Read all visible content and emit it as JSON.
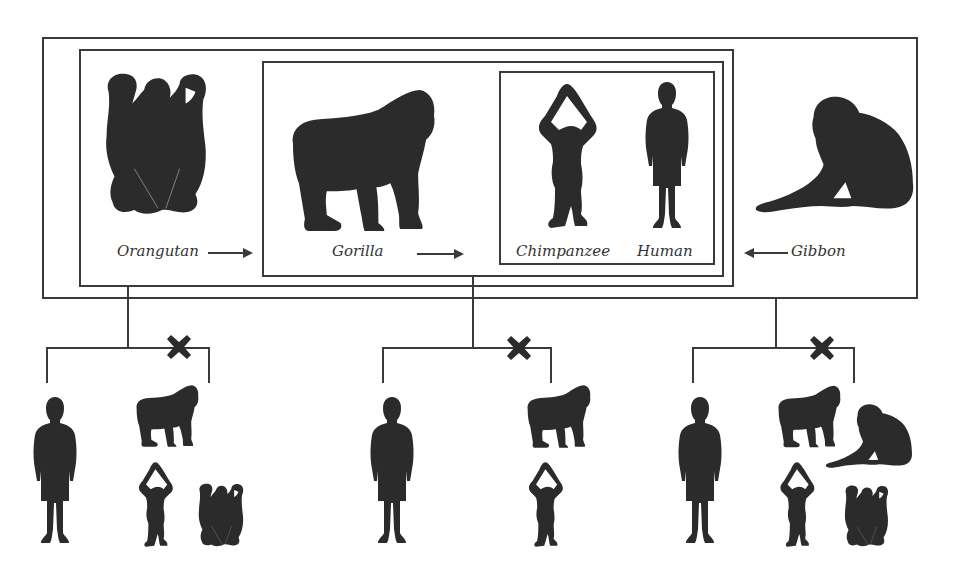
{
  "diagram": {
    "type": "great-ape-phylogeny-groupings",
    "colors": {
      "line": "#3a3a3a",
      "silhouette": "#2b2b2b",
      "background": "#ffffff"
    },
    "top_panel": {
      "labels": {
        "orangutan": "Orangutan",
        "gorilla": "Gorilla",
        "chimpanzee": "Chimpanzee",
        "human": "Human",
        "gibbon": "Gibbon"
      },
      "arrows": [
        {
          "from": "Orangutan",
          "direction": "right"
        },
        {
          "from": "Gorilla",
          "direction": "right"
        },
        {
          "from": "Gibbon",
          "direction": "left"
        }
      ],
      "nested_boxes": [
        {
          "level": 1,
          "contains": [
            "Orangutan",
            "Gorilla",
            "Chimpanzee",
            "Human",
            "Gibbon"
          ]
        },
        {
          "level": 2,
          "contains": [
            "Orangutan",
            "Gorilla",
            "Chimpanzee",
            "Human"
          ]
        },
        {
          "level": 3,
          "contains": [
            "Gorilla",
            "Chimpanzee",
            "Human"
          ]
        },
        {
          "level": 4,
          "contains": [
            "Chimpanzee",
            "Human"
          ]
        }
      ]
    },
    "bottom_groups": [
      {
        "name": "left-group",
        "stem_from": "level-2 box",
        "included": [
          "Human"
        ],
        "excluded_marked_x": [
          "Gorilla",
          "Chimpanzee",
          "Orangutan"
        ]
      },
      {
        "name": "middle-group",
        "stem_from": "level-3 box",
        "included": [
          "Human"
        ],
        "excluded_marked_x": [
          "Gorilla",
          "Chimpanzee"
        ]
      },
      {
        "name": "right-group",
        "stem_from": "level-1 box",
        "included": [
          "Human"
        ],
        "excluded_marked_x": [
          "Gorilla",
          "Gibbon",
          "Chimpanzee",
          "Orangutan"
        ]
      }
    ],
    "exclusion_mark": "✖"
  }
}
